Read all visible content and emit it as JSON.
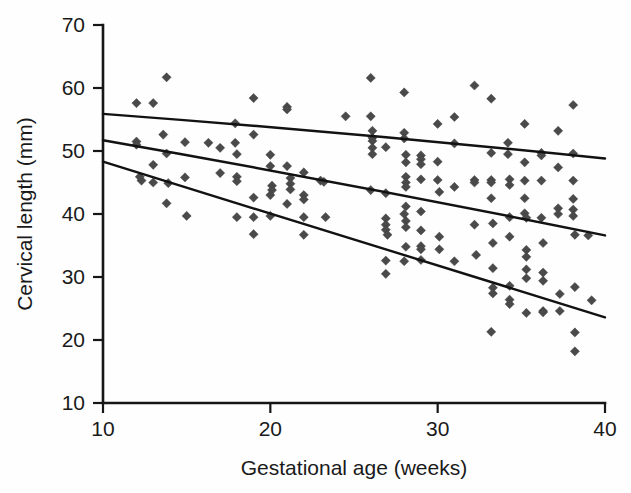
{
  "chart_data": {
    "type": "scatter",
    "title": "",
    "xlabel": "Gestational age (weeks)",
    "ylabel": "Cervical length (mm)",
    "xlim": [
      10,
      40
    ],
    "ylim": [
      10,
      70
    ],
    "xticks": [
      10,
      20,
      30,
      40
    ],
    "yticks": [
      10,
      20,
      30,
      40,
      50,
      60,
      70
    ],
    "xtick_labels": [
      "10",
      "20",
      "30",
      "40"
    ],
    "ytick_labels": [
      "10",
      "20",
      "30",
      "40",
      "50",
      "60",
      "70"
    ],
    "grid": false,
    "legend": "none",
    "marker": "diamond",
    "marker_color": "#4a4a4a",
    "line_color": "#121212",
    "series": [
      {
        "name": "Cervical length measurements",
        "type": "scatter",
        "points": [
          [
            12.0,
            57.6
          ],
          [
            12.0,
            51.5
          ],
          [
            12.0,
            51.0
          ],
          [
            12.3,
            45.3
          ],
          [
            12.2,
            45.9
          ],
          [
            13.0,
            57.6
          ],
          [
            13.0,
            47.8
          ],
          [
            13.0,
            45.0
          ],
          [
            13.6,
            52.6
          ],
          [
            13.8,
            61.7
          ],
          [
            13.8,
            49.6
          ],
          [
            13.9,
            44.9
          ],
          [
            13.8,
            41.7
          ],
          [
            14.9,
            51.4
          ],
          [
            14.9,
            45.8
          ],
          [
            15.0,
            39.7
          ],
          [
            16.3,
            51.3
          ],
          [
            17.0,
            50.5
          ],
          [
            17.0,
            46.5
          ],
          [
            17.9,
            54.4
          ],
          [
            17.9,
            51.3
          ],
          [
            18.0,
            49.5
          ],
          [
            18.0,
            45.9
          ],
          [
            18.0,
            45.2
          ],
          [
            18.0,
            39.5
          ],
          [
            19.0,
            58.4
          ],
          [
            19.0,
            52.6
          ],
          [
            19.0,
            42.6
          ],
          [
            19.0,
            39.5
          ],
          [
            19.0,
            36.8
          ],
          [
            20.0,
            49.4
          ],
          [
            20.0,
            47.6
          ],
          [
            20.1,
            44.5
          ],
          [
            20.1,
            43.8
          ],
          [
            20.0,
            43.0
          ],
          [
            20.0,
            39.7
          ],
          [
            21.0,
            57.0
          ],
          [
            21.0,
            56.6
          ],
          [
            21.0,
            47.6
          ],
          [
            21.2,
            45.7
          ],
          [
            21.2,
            44.8
          ],
          [
            21.2,
            43.9
          ],
          [
            21.0,
            41.6
          ],
          [
            22.0,
            46.6
          ],
          [
            22.0,
            43.0
          ],
          [
            22.0,
            42.3
          ],
          [
            22.0,
            39.5
          ],
          [
            22.0,
            36.7
          ],
          [
            23.0,
            45.3
          ],
          [
            23.2,
            45.1
          ],
          [
            23.3,
            39.5
          ],
          [
            24.5,
            55.5
          ],
          [
            26.0,
            61.6
          ],
          [
            26.0,
            55.5
          ],
          [
            26.1,
            53.2
          ],
          [
            26.1,
            52.1
          ],
          [
            26.1,
            51.6
          ],
          [
            26.1,
            50.5
          ],
          [
            26.1,
            49.5
          ],
          [
            26.0,
            43.8
          ],
          [
            26.9,
            50.6
          ],
          [
            26.9,
            43.3
          ],
          [
            26.9,
            39.3
          ],
          [
            26.9,
            38.3
          ],
          [
            26.9,
            37.5
          ],
          [
            27.0,
            36.7
          ],
          [
            26.9,
            32.6
          ],
          [
            26.9,
            30.5
          ],
          [
            28.0,
            59.3
          ],
          [
            28.0,
            52.9
          ],
          [
            28.0,
            52.0
          ],
          [
            28.1,
            49.4
          ],
          [
            28.1,
            48.2
          ],
          [
            28.1,
            45.9
          ],
          [
            28.1,
            45.0
          ],
          [
            28.1,
            44.3
          ],
          [
            28.1,
            41.2
          ],
          [
            28.0,
            40.0
          ],
          [
            28.1,
            38.9
          ],
          [
            28.1,
            37.9
          ],
          [
            28.1,
            34.8
          ],
          [
            28.0,
            32.5
          ],
          [
            29.0,
            49.3
          ],
          [
            29.0,
            48.7
          ],
          [
            29.0,
            47.9
          ],
          [
            29.0,
            45.5
          ],
          [
            29.0,
            40.4
          ],
          [
            29.0,
            37.4
          ],
          [
            29.0,
            34.9
          ],
          [
            29.0,
            34.4
          ],
          [
            29.0,
            32.7
          ],
          [
            30.0,
            54.3
          ],
          [
            30.0,
            48.3
          ],
          [
            30.0,
            45.4
          ],
          [
            30.1,
            43.5
          ],
          [
            30.1,
            36.4
          ],
          [
            30.1,
            34.4
          ],
          [
            31.0,
            55.4
          ],
          [
            31.0,
            51.2
          ],
          [
            31.0,
            44.3
          ],
          [
            31.0,
            32.5
          ],
          [
            32.2,
            60.4
          ],
          [
            32.2,
            45.4
          ],
          [
            32.2,
            45.0
          ],
          [
            32.2,
            38.3
          ],
          [
            32.3,
            33.5
          ],
          [
            33.2,
            58.3
          ],
          [
            33.2,
            49.7
          ],
          [
            33.2,
            45.4
          ],
          [
            33.2,
            45.0
          ],
          [
            33.2,
            42.5
          ],
          [
            33.3,
            38.5
          ],
          [
            33.3,
            35.4
          ],
          [
            33.3,
            31.4
          ],
          [
            33.3,
            28.3
          ],
          [
            33.3,
            27.4
          ],
          [
            33.2,
            21.3
          ],
          [
            34.2,
            51.3
          ],
          [
            34.2,
            49.5
          ],
          [
            34.3,
            45.5
          ],
          [
            34.3,
            44.6
          ],
          [
            34.3,
            39.5
          ],
          [
            34.3,
            36.4
          ],
          [
            34.3,
            28.6
          ],
          [
            34.3,
            26.4
          ],
          [
            34.3,
            25.7
          ],
          [
            35.2,
            54.3
          ],
          [
            35.2,
            48.2
          ],
          [
            35.2,
            45.3
          ],
          [
            35.2,
            42.5
          ],
          [
            35.2,
            40.1
          ],
          [
            35.3,
            39.4
          ],
          [
            35.3,
            34.3
          ],
          [
            35.3,
            33.2
          ],
          [
            35.3,
            31.2
          ],
          [
            35.3,
            29.8
          ],
          [
            35.3,
            24.3
          ],
          [
            36.2,
            49.7
          ],
          [
            36.2,
            49.3
          ],
          [
            36.2,
            45.3
          ],
          [
            36.2,
            39.4
          ],
          [
            36.3,
            35.4
          ],
          [
            36.3,
            30.7
          ],
          [
            36.3,
            29.4
          ],
          [
            36.3,
            24.6
          ],
          [
            36.3,
            24.4
          ],
          [
            37.2,
            53.2
          ],
          [
            37.2,
            47.4
          ],
          [
            37.2,
            40.9
          ],
          [
            37.2,
            40.0
          ],
          [
            37.3,
            27.3
          ],
          [
            37.3,
            24.6
          ],
          [
            38.1,
            57.3
          ],
          [
            38.1,
            49.6
          ],
          [
            38.1,
            45.3
          ],
          [
            38.1,
            42.4
          ],
          [
            38.1,
            40.7
          ],
          [
            38.1,
            39.7
          ],
          [
            38.2,
            36.7
          ],
          [
            38.2,
            28.4
          ],
          [
            38.2,
            21.2
          ],
          [
            38.2,
            18.2
          ],
          [
            39.0,
            36.6
          ],
          [
            39.2,
            26.3
          ]
        ]
      }
    ],
    "fit_lines": [
      {
        "name": "upper-percentile-line",
        "x": [
          10,
          40
        ],
        "y": [
          55.9,
          48.8
        ],
        "curved": true
      },
      {
        "name": "median-line",
        "x": [
          10,
          40
        ],
        "y": [
          51.7,
          36.6
        ],
        "curved": true
      },
      {
        "name": "lower-percentile-line",
        "x": [
          10,
          40
        ],
        "y": [
          48.3,
          23.6
        ],
        "curved": false
      }
    ]
  }
}
